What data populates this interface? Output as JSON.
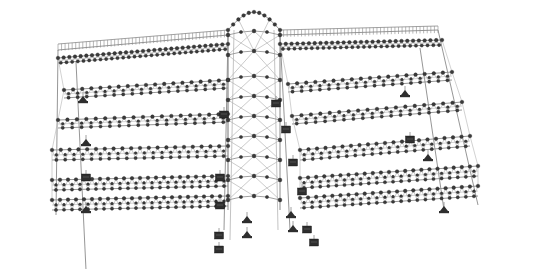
{
  "diagram": {
    "type": "structural-frame-model",
    "width": 534,
    "height": 269,
    "colors": {
      "background": "#ffffff",
      "member": "#8a8a8a",
      "member_light": "#b4b4b4",
      "node": "#3a3a3a",
      "node_stroke": "#222222",
      "support": "#2e2e2e"
    },
    "left_wing": {
      "top_chord": {
        "x1": 58,
        "y1": 50,
        "x2": 228,
        "y2": 35
      },
      "roof_fringe": {
        "x1": 58,
        "y1": 44,
        "x2": 228,
        "y2": 30,
        "count": 48
      },
      "trusses": [
        {
          "x1": 58,
          "y1": 58,
          "x2": 228,
          "y2": 44,
          "depth": 5,
          "panels": 30
        },
        {
          "x1": 64,
          "y1": 90,
          "x2": 228,
          "y2": 80,
          "depth": 8,
          "panels": 18
        },
        {
          "x1": 58,
          "y1": 120,
          "x2": 228,
          "y2": 114,
          "depth": 8,
          "panels": 18
        },
        {
          "x1": 52,
          "y1": 150,
          "x2": 228,
          "y2": 146,
          "depth": 10,
          "panels": 20
        },
        {
          "x1": 52,
          "y1": 180,
          "x2": 228,
          "y2": 176,
          "depth": 10,
          "panels": 22
        },
        {
          "x1": 52,
          "y1": 200,
          "x2": 228,
          "y2": 196,
          "depth": 10,
          "panels": 22
        }
      ],
      "columns": [
        {
          "x1": 58,
          "y1": 50,
          "x2": 56,
          "y2": 215
        },
        {
          "x1": 76,
          "y1": 62,
          "x2": 86,
          "y2": 270
        },
        {
          "x1": 228,
          "y1": 35,
          "x2": 224,
          "y2": 230
        }
      ]
    },
    "right_wing": {
      "top_chord": {
        "x1": 280,
        "y1": 35,
        "x2": 438,
        "y2": 30
      },
      "roof_fringe": {
        "x1": 280,
        "y1": 30,
        "x2": 438,
        "y2": 26,
        "count": 44
      },
      "trusses": [
        {
          "x1": 280,
          "y1": 44,
          "x2": 442,
          "y2": 40,
          "depth": 5,
          "panels": 28
        },
        {
          "x1": 288,
          "y1": 84,
          "x2": 452,
          "y2": 72,
          "depth": 8,
          "panels": 18
        },
        {
          "x1": 292,
          "y1": 116,
          "x2": 462,
          "y2": 102,
          "depth": 8,
          "panels": 18
        },
        {
          "x1": 300,
          "y1": 150,
          "x2": 470,
          "y2": 136,
          "depth": 10,
          "panels": 20
        },
        {
          "x1": 300,
          "y1": 178,
          "x2": 478,
          "y2": 166,
          "depth": 10,
          "panels": 22
        },
        {
          "x1": 300,
          "y1": 198,
          "x2": 478,
          "y2": 186,
          "depth": 10,
          "panels": 22
        }
      ],
      "columns": [
        {
          "x1": 438,
          "y1": 30,
          "x2": 478,
          "y2": 205
        },
        {
          "x1": 420,
          "y1": 48,
          "x2": 444,
          "y2": 210
        },
        {
          "x1": 280,
          "y1": 35,
          "x2": 290,
          "y2": 230
        }
      ]
    },
    "central_tower": {
      "x_left": 228,
      "x_right": 280,
      "y_top": 12,
      "y_bottom": 210,
      "arch_rise": 18,
      "bands": [
        35,
        55,
        80,
        100,
        120,
        140,
        160,
        180,
        200
      ]
    },
    "supports": [
      {
        "x": 83,
        "y": 100,
        "kind": "pin"
      },
      {
        "x": 86,
        "y": 143,
        "kind": "pin"
      },
      {
        "x": 86,
        "y": 178,
        "kind": "fixed"
      },
      {
        "x": 86,
        "y": 210,
        "kind": "pin"
      },
      {
        "x": 220,
        "y": 178,
        "kind": "fixed"
      },
      {
        "x": 220,
        "y": 206,
        "kind": "fixed"
      },
      {
        "x": 219,
        "y": 236,
        "kind": "fixed"
      },
      {
        "x": 219,
        "y": 250,
        "kind": "fixed"
      },
      {
        "x": 247,
        "y": 220,
        "kind": "pin"
      },
      {
        "x": 247,
        "y": 235,
        "kind": "pin"
      },
      {
        "x": 291,
        "y": 215,
        "kind": "pin"
      },
      {
        "x": 293,
        "y": 229,
        "kind": "pin"
      },
      {
        "x": 307,
        "y": 230,
        "kind": "fixed"
      },
      {
        "x": 314,
        "y": 243,
        "kind": "fixed"
      },
      {
        "x": 293,
        "y": 163,
        "kind": "fixed"
      },
      {
        "x": 302,
        "y": 192,
        "kind": "fixed"
      },
      {
        "x": 276,
        "y": 104,
        "kind": "fixed"
      },
      {
        "x": 286,
        "y": 130,
        "kind": "fixed"
      },
      {
        "x": 405,
        "y": 94,
        "kind": "pin"
      },
      {
        "x": 410,
        "y": 140,
        "kind": "fixed"
      },
      {
        "x": 428,
        "y": 158,
        "kind": "pin"
      },
      {
        "x": 444,
        "y": 210,
        "kind": "pin"
      },
      {
        "x": 224,
        "y": 115,
        "kind": "fixed"
      }
    ]
  }
}
